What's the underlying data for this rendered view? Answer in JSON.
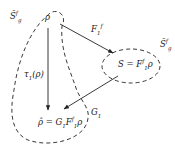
{
  "diagram": {
    "nodes": {
      "rho": {
        "label": "ρ"
      },
      "S": {
        "label": "S = F",
        "sup": "f",
        "sub": "1",
        "tail": "ρ"
      },
      "rho_hat": {
        "label": "ρ̂ = G",
        "sub1": "1",
        "mid": "F",
        "sup": "f",
        "sub2": "1",
        "tail": "ρ"
      }
    },
    "regions": {
      "left": {
        "label": "S̄",
        "sup": "f",
        "sub": "g"
      },
      "right": {
        "label": "S̄",
        "sup": "f",
        "sub": "g"
      }
    },
    "edges": {
      "F1f": {
        "label": "F",
        "sub": "1",
        "sup": "f",
        "from": "rho",
        "to": "S"
      },
      "tau1": {
        "label": "τ",
        "sub": "1",
        "tail": "(ρ)",
        "from": "rho",
        "to": "rho_hat"
      },
      "G1": {
        "label": "G",
        "sub": "1",
        "from": "S",
        "to": "rho_hat"
      }
    },
    "colors": {
      "line": "#222222",
      "background": "#ffffff"
    }
  }
}
